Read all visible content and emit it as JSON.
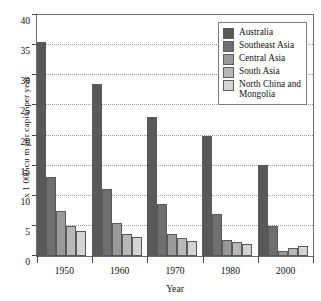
{
  "chart_data": {
    "type": "bar",
    "title": "",
    "xlabel": "Year",
    "ylabel": "x 1 000 cu m per capita per year",
    "categories": [
      "1950",
      "1960",
      "1970",
      "1980",
      "2000"
    ],
    "ylim": [
      0,
      40
    ],
    "yticks": [
      0,
      5,
      10,
      15,
      20,
      25,
      30,
      35,
      40
    ],
    "ytick_labels": [
      "0",
      "5",
      "10",
      "15",
      "20",
      "25",
      "30",
      "35",
      "40"
    ],
    "grid": true,
    "legend_position": "top-right",
    "series": [
      {
        "name": "Australia",
        "color": "#59595c",
        "values": [
          35.6,
          28.5,
          23.0,
          20.0,
          15.1
        ]
      },
      {
        "name": "Southeast Asia",
        "color": "#6f6f71",
        "values": [
          13.1,
          11.1,
          8.6,
          7.0,
          4.9
        ]
      },
      {
        "name": "Central Asia",
        "color": "#9a9a9a",
        "values": [
          7.5,
          5.5,
          3.6,
          2.6,
          0.8
        ]
      },
      {
        "name": "South Asia",
        "color": "#b8b8b8",
        "values": [
          5.0,
          3.6,
          3.0,
          2.3,
          1.3
        ]
      },
      {
        "name": "North China and\nMongolia",
        "color": "#d4d4d4",
        "values": [
          4.1,
          3.1,
          2.5,
          2.0,
          1.6
        ]
      }
    ]
  }
}
